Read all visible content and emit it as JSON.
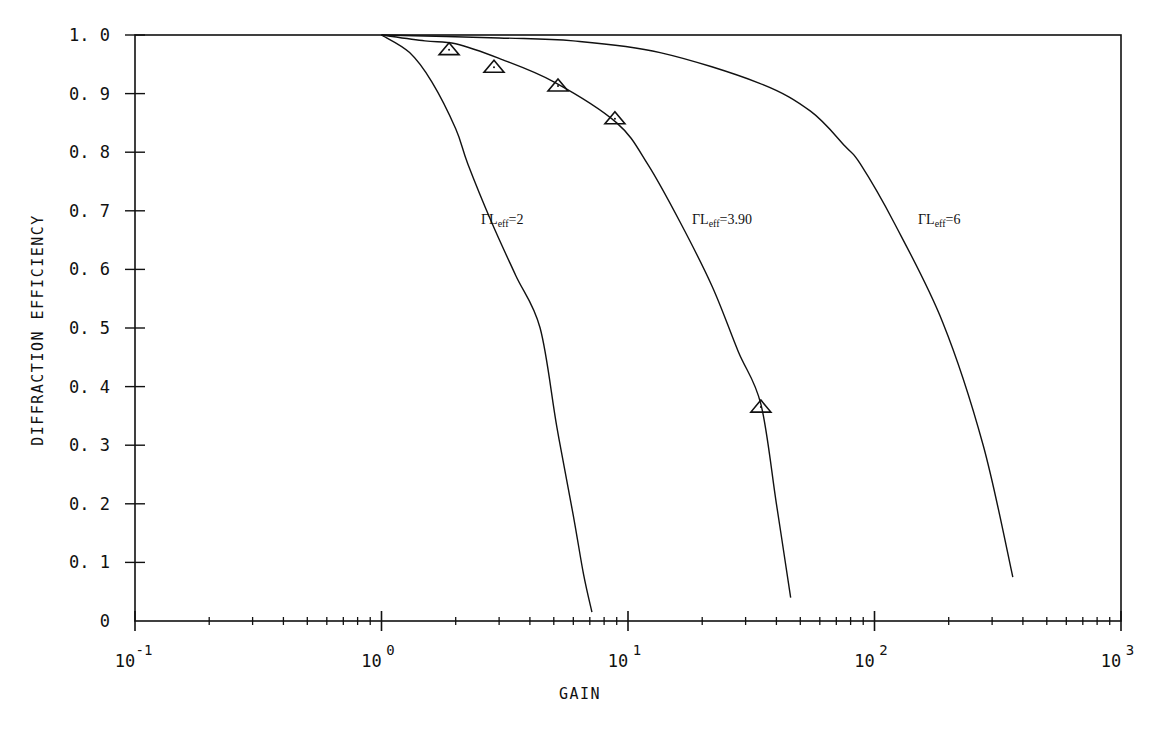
{
  "chart_data": {
    "type": "line",
    "title": "",
    "xlabel": "GAIN",
    "ylabel": "DIFFRACTION EFFICIENCY",
    "xscale": "log",
    "xlim": [
      0.1,
      1000
    ],
    "ylim": [
      0,
      1.0
    ],
    "grid": false,
    "legend": "inline curve labels",
    "x_ticks": [
      {
        "value": 0.1,
        "base": "10",
        "exp": "-1"
      },
      {
        "value": 1,
        "base": "10",
        "exp": "0"
      },
      {
        "value": 10,
        "base": "10",
        "exp": "1"
      },
      {
        "value": 100,
        "base": "10",
        "exp": "2"
      },
      {
        "value": 1000,
        "base": "10",
        "exp": "3"
      }
    ],
    "y_ticks": [
      "0",
      "0.1",
      "0.2",
      "0.3",
      "0.4",
      "0.5",
      "0.6",
      "0.7",
      "0.8",
      "0.9",
      "1.0"
    ],
    "series": [
      {
        "name": "ΓLeff=2",
        "label_main": "ΓL",
        "label_sub": "eff",
        "label_tail": "=2",
        "label_pos": [
          481,
          224
        ],
        "x": [
          1.0,
          1.3,
          1.6,
          2.0,
          2.24,
          2.8,
          3.5,
          4.4,
          5.15,
          6.0,
          6.6,
          7.14
        ],
        "y": [
          1.0,
          0.97,
          0.92,
          0.84,
          0.78,
          0.68,
          0.59,
          0.5,
          0.33,
          0.18,
          0.08,
          0.015
        ]
      },
      {
        "name": "ΓLeff=3.90",
        "label_main": "ΓL",
        "label_sub": "eff",
        "label_tail": "=3.90",
        "label_pos": [
          692,
          224
        ],
        "x": [
          1.0,
          1.5,
          2.0,
          3.0,
          5.0,
          9.0,
          12.0,
          16.3,
          22.0,
          28.0,
          34.6,
          40.0,
          45.7
        ],
        "y": [
          1.0,
          0.99,
          0.985,
          0.96,
          0.92,
          0.85,
          0.78,
          0.68,
          0.57,
          0.46,
          0.37,
          0.2,
          0.04
        ]
      },
      {
        "name": "ΓLeff=6",
        "label_main": "ΓL",
        "label_sub": "eff",
        "label_tail": "=6",
        "label_pos": [
          918,
          224
        ],
        "x": [
          1.0,
          3.0,
          6.0,
          13.5,
          34.0,
          55.0,
          76.0,
          87.6,
          120.0,
          189.0,
          276.0,
          364.0
        ],
        "y": [
          1.0,
          0.995,
          0.99,
          0.97,
          0.918,
          0.87,
          0.81,
          0.78,
          0.68,
          0.51,
          0.3,
          0.075
        ]
      }
    ],
    "markers": {
      "name": "Experimental data",
      "symbol": "triangle",
      "x": [
        1.88,
        2.86,
        5.2,
        8.85,
        34.6
      ],
      "y": [
        0.975,
        0.945,
        0.913,
        0.857,
        0.365
      ]
    }
  },
  "colors": {
    "line": "#111111",
    "background": "#ffffff"
  }
}
